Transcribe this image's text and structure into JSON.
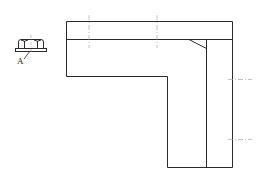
{
  "diagram": {
    "type": "technical-drawing",
    "stroke_color": "#2a2a2a",
    "centerline_color": "#9a9a9a",
    "background": "#ffffff"
  },
  "detail": {
    "callout_label": "A",
    "icon": "flange-nut-icon"
  },
  "part": {
    "shape": "L-shaped bracket",
    "outline": [
      [
        66,
        21
      ],
      [
        232,
        21
      ],
      [
        232,
        167
      ],
      [
        167,
        167
      ],
      [
        167,
        76
      ],
      [
        66,
        76
      ]
    ],
    "inner_horizontal_line_y": 39,
    "inner_vertical_line_x": 206,
    "chamfer": [
      [
        189,
        39
      ],
      [
        206,
        48
      ]
    ],
    "centerlines_vertical": [
      89,
      157
    ],
    "centerlines_horizontal": [
      79,
      139
    ]
  }
}
